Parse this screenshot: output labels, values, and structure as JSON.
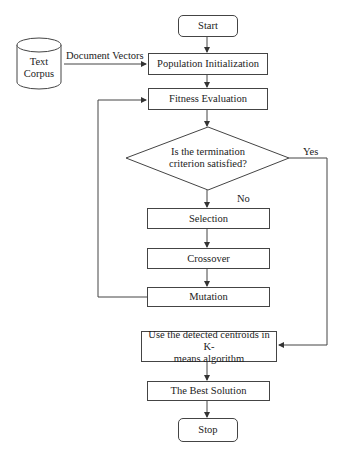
{
  "diagram": {
    "type": "flowchart",
    "nodes": {
      "start": "Start",
      "text_corpus_line1": "Text",
      "text_corpus_line2": "Corpus",
      "population_init": "Population Initialization",
      "fitness_eval": "Fitness Evaluation",
      "decision_line1": "Is the termination",
      "decision_line2": "criterion satisfied?",
      "selection": "Selection",
      "crossover": "Crossover",
      "mutation": "Mutation",
      "kmeans_line1": "Use the detected centroids in K-",
      "kmeans_line2": "means algorithm",
      "best_solution": "The Best Solution",
      "stop": "Stop"
    },
    "edge_labels": {
      "document_vectors": "Document Vectors",
      "yes": "Yes",
      "no": "No"
    },
    "edges": [
      [
        "Start",
        "Population Initialization"
      ],
      [
        "Text Corpus",
        "Population Initialization",
        "Document Vectors"
      ],
      [
        "Population Initialization",
        "Fitness Evaluation"
      ],
      [
        "Fitness Evaluation",
        "Is the termination criterion satisfied?"
      ],
      [
        "Is the termination criterion satisfied?",
        "Selection",
        "No"
      ],
      [
        "Is the termination criterion satisfied?",
        "Use the detected centroids in K-means algorithm",
        "Yes"
      ],
      [
        "Selection",
        "Crossover"
      ],
      [
        "Crossover",
        "Mutation"
      ],
      [
        "Mutation",
        "Fitness Evaluation"
      ],
      [
        "Use the detected centroids in K-means algorithm",
        "The Best Solution"
      ],
      [
        "The Best Solution",
        "Stop"
      ]
    ],
    "colors": {
      "stroke": "#444444",
      "text": "#222222",
      "background": "#ffffff"
    }
  }
}
